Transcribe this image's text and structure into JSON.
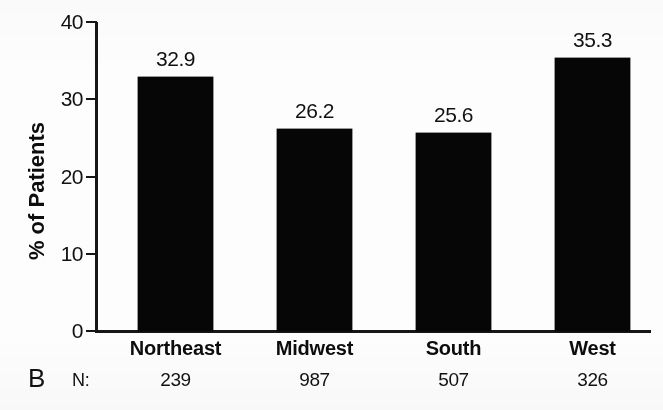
{
  "figure": {
    "panel_letter": "B",
    "n_row_label": "N:"
  },
  "chart_data": {
    "type": "bar",
    "title": "",
    "xlabel": "",
    "ylabel": "% of Patients",
    "ylim": [
      0,
      40
    ],
    "yticks": [
      0,
      10,
      20,
      30,
      40
    ],
    "ytick_labels": [
      "0",
      "10",
      "20",
      "30",
      "40"
    ],
    "grid": false,
    "legend": null,
    "bar_color": "#060606",
    "categories": [
      "Northeast",
      "Midwest",
      "South",
      "West"
    ],
    "values": [
      32.9,
      26.2,
      25.6,
      35.3
    ],
    "value_labels": [
      "32.9",
      "26.2",
      "25.6",
      "35.3"
    ],
    "sample_sizes": [
      239,
      987,
      507,
      326
    ],
    "sample_size_labels": [
      "239",
      "987",
      "507",
      "326"
    ]
  }
}
